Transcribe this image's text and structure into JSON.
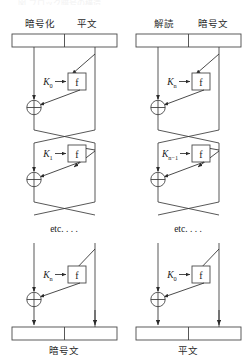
{
  "figure": {
    "top_partial_caption": "図 ブロック暗号の構造",
    "panels": [
      {
        "id": "encrypt",
        "headers": {
          "left": "暗号化",
          "right": "平文"
        },
        "bottom_label": "暗号文",
        "rounds": [
          {
            "key": "K",
            "subscript": "0",
            "function": "f"
          },
          {
            "key": "K",
            "subscript": "1",
            "function": "f"
          },
          {
            "key": "K",
            "subscript": "n",
            "function": "f"
          }
        ],
        "ellipsis": "etc. . . ."
      },
      {
        "id": "decrypt",
        "headers": {
          "left": "解読",
          "right": "暗号文"
        },
        "bottom_label": "平文",
        "rounds": [
          {
            "key": "K",
            "subscript": "n",
            "function": "f"
          },
          {
            "key": "K",
            "subscript": "n−1",
            "function": "f"
          },
          {
            "key": "K",
            "subscript": "0",
            "function": "f"
          }
        ],
        "ellipsis": "etc. . . ."
      }
    ],
    "symbols": {
      "xor": "⊕",
      "arrow": "→"
    },
    "colors": {
      "line": "#3a3a3a",
      "box_stroke": "#4a4a4a",
      "text": "#1a1a1a",
      "header_text": "#2b2b2b",
      "background": "#ffffff"
    }
  }
}
